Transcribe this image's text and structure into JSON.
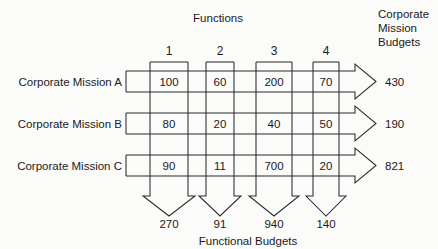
{
  "diagram": {
    "top_title": "Functions",
    "bottom_title": "Functional Budgets",
    "right_title_lines": [
      "Corporate",
      "Mission",
      "Budgets"
    ],
    "column_headers": [
      "1",
      "2",
      "3",
      "4"
    ],
    "row_labels": [
      "Corporate Mission A",
      "Corporate Mission B",
      "Corporate Mission C"
    ],
    "cells": [
      [
        "100",
        "60",
        "200",
        "70"
      ],
      [
        "80",
        "20",
        "40",
        "50"
      ],
      [
        "90",
        "11",
        "700",
        "20"
      ]
    ],
    "row_totals": [
      "430",
      "190",
      "821"
    ],
    "column_totals": [
      "270",
      "91",
      "940",
      "140"
    ],
    "colors": {
      "ink": "#1a1a1a",
      "line": "#2b2b2b",
      "background": "#fbfbfa"
    }
  }
}
